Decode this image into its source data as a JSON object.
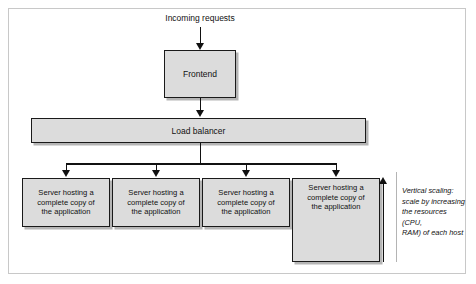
{
  "figure": {
    "colors": {
      "node_fill": "#dcdcdc",
      "node_border": "#1a1a1a",
      "frame_border": "#c8c8c8",
      "background": "#ffffff",
      "connector": "#111111",
      "rule": "#b4b4b4"
    }
  },
  "labels": {
    "incoming_requests": "Incoming requests",
    "frontend": "Frontend",
    "load_balancer": "Load balancer",
    "vertical_scaling_note": "Vertical scaling:\nscale by increasing\nthe resources (CPU,\nRAM) of each host"
  },
  "servers": [
    {
      "id": "server-1",
      "label": "Server hosting a\ncomplete copy of\nthe application",
      "tall": false
    },
    {
      "id": "server-2",
      "label": "Server hosting a\ncomplete copy of\nthe application",
      "tall": false
    },
    {
      "id": "server-3",
      "label": "Server hosting a\ncomplete copy of\nthe application",
      "tall": false
    },
    {
      "id": "server-4",
      "label": "Server hosting a\ncomplete copy of\nthe application",
      "tall": true
    }
  ]
}
